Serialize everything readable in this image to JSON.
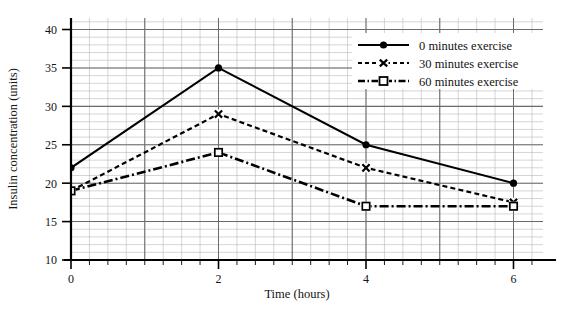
{
  "chart_data": {
    "type": "line",
    "title": "",
    "xlabel": "Time (hours)",
    "ylabel": "Insulin concentration (units)",
    "x": [
      0,
      2,
      4,
      6
    ],
    "xlim": [
      0,
      6.4
    ],
    "ylim": [
      10,
      41.5
    ],
    "xticks": [
      0,
      2,
      4,
      6
    ],
    "xtick_labels": [
      "0",
      "2",
      "4",
      "6"
    ],
    "yticks": [
      10,
      15,
      20,
      25,
      30,
      35,
      40
    ],
    "ytick_labels": [
      "10",
      "15",
      "20",
      "25",
      "30",
      "35",
      "40"
    ],
    "grid": "major and minor gridlines, graph paper style",
    "legend_position": "upper right",
    "series": [
      {
        "name": "0 minutes exercise",
        "values": [
          22,
          35,
          25,
          20
        ],
        "linestyle": "solid",
        "marker": "filled-circle",
        "color": "#000000"
      },
      {
        "name": "30 minutes exercise",
        "values": [
          19,
          29,
          22,
          17.5
        ],
        "linestyle": "dotted-dashed",
        "marker": "cross-x",
        "color": "#000000"
      },
      {
        "name": "60 minutes exercise",
        "values": [
          19,
          24,
          17,
          17
        ],
        "linestyle": "dash-dot",
        "marker": "open-square",
        "color": "#000000"
      }
    ]
  },
  "axes": {
    "x_title": "Time (hours)",
    "y_title": "Insulin concentration (units)"
  },
  "legend": {
    "entries": [
      {
        "label": "0 minutes exercise"
      },
      {
        "label": "30 minutes exercise"
      },
      {
        "label": "60 minutes exercise"
      }
    ]
  },
  "colors": {
    "ink": "#000000",
    "grid_minor": "#b9b9b9",
    "grid_major": "#6b6b6b",
    "background": "#ffffff"
  }
}
